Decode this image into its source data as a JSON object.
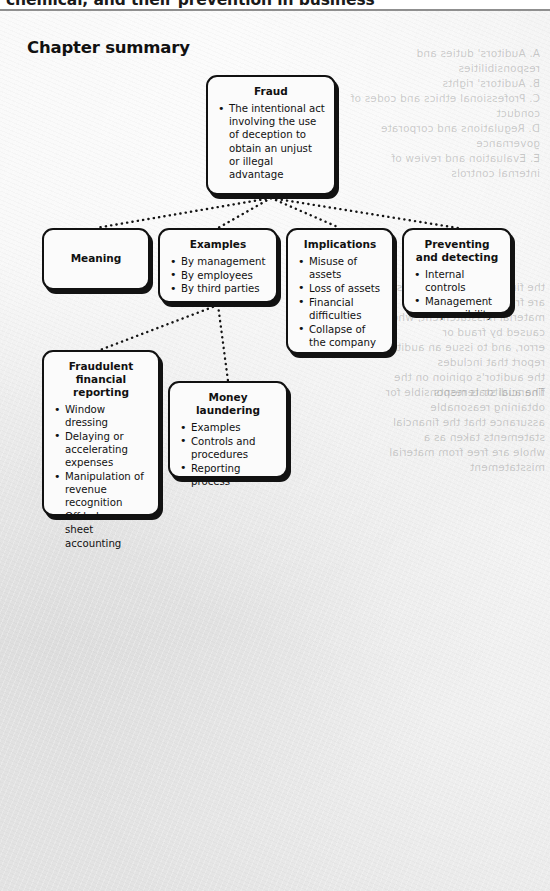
{
  "header": {
    "running_head": "chemical, and their prevention in business"
  },
  "page": {
    "title": "Chapter summary"
  },
  "diagram": {
    "type": "flowchart",
    "nodes": [
      {
        "id": "fraud",
        "title": "Fraud",
        "items": [
          "The intentional act involving the use of deception to obtain an unjust or illegal advantage"
        ]
      },
      {
        "id": "meaning",
        "title": "Meaning",
        "items": []
      },
      {
        "id": "examples",
        "title": "Examples",
        "items": [
          "By management",
          "By employees",
          "By third parties"
        ]
      },
      {
        "id": "implications",
        "title": "Implications",
        "items": [
          "Misuse of assets",
          "Loss of assets",
          "Financial difficulties",
          "Collapse of the company"
        ]
      },
      {
        "id": "preventing",
        "title": "Preventing and detecting",
        "items": [
          "Internal controls",
          "Management responsibility"
        ]
      },
      {
        "id": "fraudulent-reporting",
        "title": "Fraudulent financial reporting",
        "items": [
          "Window dressing",
          "Delaying or accelerating expenses",
          "Manipulation of revenue recognition",
          "Off balance sheet accounting"
        ]
      },
      {
        "id": "money-laundering",
        "title": "Money laundering",
        "items": [
          "Examples",
          "Controls and procedures",
          "Reporting process"
        ]
      }
    ],
    "edges": [
      {
        "from": "fraud",
        "to": "meaning"
      },
      {
        "from": "fraud",
        "to": "examples"
      },
      {
        "from": "fraud",
        "to": "implications"
      },
      {
        "from": "fraud",
        "to": "preventing"
      },
      {
        "from": "examples",
        "to": "fraudulent-reporting"
      },
      {
        "from": "examples",
        "to": "money-laundering"
      }
    ]
  },
  "colors": {
    "page_background": "#e6e6e6",
    "node_fill": "#fbfbfb",
    "node_border": "#111111",
    "text": "#111111"
  },
  "ghost_text": {
    "block_a": "A. Auditors' duties and responsibilities\nB. Auditors' rights\nC. Professional ethics and codes of conduct\nD. Regulations and corporate governance\nE. Evaluation and review of internal controls",
    "block_b": "the financial statements as a whole are free from\nmaterial misstatement, whether caused by fraud or\nerror, and to issue an auditor's report that includes\nthe auditor's opinion on the financial statements",
    "block_c": "The auditor is responsible for obtaining reasonable\nassurance that the financial statements taken as a\nwhole are free from material misstatement"
  }
}
